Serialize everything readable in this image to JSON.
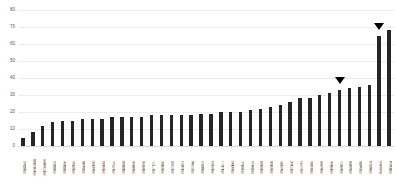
{
  "chart_data": {
    "type": "bar",
    "title": "",
    "subtitle": "",
    "xlabel": "",
    "ylabel": "",
    "ylim": [
      0,
      80
    ],
    "y_ticks": [
      0,
      10,
      20,
      30,
      40,
      50,
      60,
      70,
      80
    ],
    "grid": true,
    "legend": "none",
    "bar_color": "#262626",
    "gridline_color": "#ececec",
    "tick_label_color": "#595959",
    "categories": [
      "沖縄県",
      "鹿児島県",
      "和歌山県",
      "宮崎県",
      "長崎県",
      "高知県",
      "熊本県",
      "佐賀県",
      "徳島県",
      "大分県",
      "愛媛県",
      "島根県",
      "鳥取県",
      "山口県",
      "福岡県",
      "岡山県",
      "広島県",
      "香川県",
      "兵庫県",
      "奈良県",
      "三重県",
      "滋賀県",
      "大阪府",
      "京都府",
      "愛知県",
      "静岡県",
      "岐阜県",
      "富山県",
      "石川県",
      "福井県",
      "新潟県",
      "長野県",
      "山梨県",
      "群馬県",
      "栃木県",
      "茨城県",
      "北海道",
      "青森県"
    ],
    "values": [
      5,
      8,
      12,
      14,
      15,
      15,
      16,
      16,
      16,
      17,
      17,
      17,
      17,
      18,
      18,
      18,
      18,
      18,
      19,
      19,
      20,
      20,
      20,
      21,
      22,
      23,
      24,
      26,
      28,
      28,
      30,
      31,
      33,
      34,
      35,
      36,
      65,
      68
    ],
    "annotations": [
      {
        "name": "marker-triangle-1",
        "category_index": 32,
        "value": 33,
        "symbol": "▼"
      },
      {
        "name": "marker-triangle-2",
        "category_index": 36,
        "value": 65,
        "symbol": "▼"
      }
    ]
  }
}
